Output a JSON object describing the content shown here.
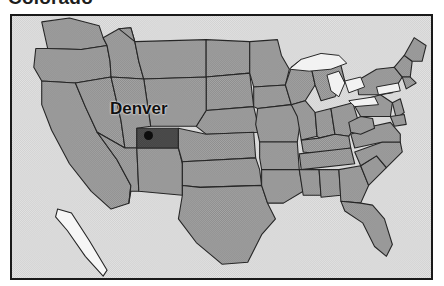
{
  "title": "Colorado",
  "map": {
    "name": "united-states-map",
    "frame_border_color": "#1a1a1a",
    "ocean_color": "#dcdcdc",
    "state_fill_color": "#9a9a9a",
    "highlight_fill_color": "#4a4a4a",
    "state_border_color": "#262626",
    "lake_color": "#f2f2f2",
    "highlighted_state": "Colorado"
  },
  "city": {
    "label": "Denver",
    "marker_name": "city-dot-marker",
    "marker_color": "#0d0d0d"
  }
}
